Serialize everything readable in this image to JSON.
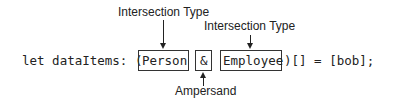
{
  "diagram": {
    "code": {
      "prefix": "let dataItems: (",
      "type1": "Person",
      "operator": "&",
      "type2": "Employee",
      "suffix": ")[] = [bob];"
    },
    "annotations": {
      "type1_label": "Intersection Type",
      "type2_label": "Intersection Type",
      "operator_label": "Ampersand"
    }
  }
}
